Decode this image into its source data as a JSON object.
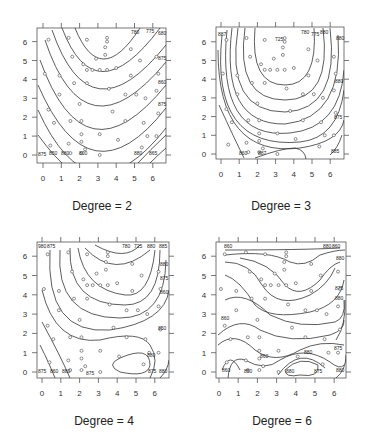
{
  "chart_data": [
    {
      "type": "contour",
      "title": "Degree = 2",
      "caption": "Degree = 2",
      "xlabel": "",
      "ylabel": "",
      "xlim": [
        -0.2,
        6.6
      ],
      "ylim": [
        -0.2,
        6.6
      ],
      "x_ticks": [
        "0",
        "1",
        "2",
        "3",
        "4",
        "5",
        "6"
      ],
      "y_ticks": [
        "0",
        "1",
        "2",
        "3",
        "4",
        "5",
        "6"
      ],
      "contour_labels": [
        "780",
        "775",
        "680",
        "875",
        "860",
        "800",
        "875",
        "850",
        "880",
        "800",
        "860",
        "850",
        "875",
        "880"
      ],
      "frame": {
        "x": 37,
        "y": 28,
        "w": 129,
        "h": 135
      },
      "axis": {
        "x0": 43,
        "xstep": 18.3,
        "y0": 155,
        "ystep": 18.9
      },
      "curves": [
        "M75,28 Q100,90 140,28",
        "M62,28 Q95,115 160,28",
        "M52,30 Q90,140 166,45",
        "M45,40 Q85,160 166,62",
        "M40,60 Q85,185 166,85",
        "M38,85 Q90,205 166,108",
        "M38,110 Q90,225 166,128",
        "M38,135 Q75,185 80,163",
        "M138,163 Q150,150 166,135",
        "M150,163 Q158,155 166,148"
      ],
      "labels": [
        {
          "t": "780",
          "x": 131,
          "y": 34
        },
        {
          "t": "775",
          "x": 146,
          "y": 33
        },
        {
          "t": "680",
          "x": 158,
          "y": 35
        },
        {
          "t": "875",
          "x": 158,
          "y": 60
        },
        {
          "t": "860",
          "x": 158,
          "y": 84
        },
        {
          "t": "875",
          "x": 158,
          "y": 106
        },
        {
          "t": "875",
          "x": 38,
          "y": 156
        },
        {
          "t": "850",
          "x": 49,
          "y": 155
        },
        {
          "t": "880",
          "x": 61,
          "y": 155
        },
        {
          "t": "800",
          "x": 79,
          "y": 155
        },
        {
          "t": "880",
          "x": 134,
          "y": 155
        },
        {
          "t": "865",
          "x": 149,
          "y": 155
        }
      ]
    },
    {
      "type": "contour",
      "title": "Degree = 3",
      "caption": "Degree = 3",
      "xlabel": "",
      "ylabel": "",
      "xlim": [
        -0.2,
        6.6
      ],
      "ylim": [
        -0.2,
        6.6
      ],
      "x_ticks": [
        "0",
        "1",
        "2",
        "3",
        "4",
        "5",
        "6"
      ],
      "y_ticks": [
        "0",
        "1",
        "2",
        "3",
        "4",
        "5",
        "6"
      ],
      "contour_labels": [
        "887",
        "780",
        "725",
        "775",
        "880",
        "880",
        "875",
        "860",
        "887",
        "885"
      ],
      "frame": {
        "x": 216,
        "y": 27,
        "w": 128,
        "h": 132
      },
      "axis": {
        "x0": 221,
        "xstep": 18.2,
        "y0": 154,
        "ystep": 18.7
      },
      "curves": [
        "M255,28 Q250,85 285,85 Q318,85 314,28",
        "M245,28 Q235,100 285,100 Q332,100 323,28",
        "M238,28 Q225,112 285,112 Q340,110 330,28",
        "M232,28 Q220,125 285,124 Q344,118 338,35",
        "M227,30 Q216,140 290,133 Q340,128 344,70",
        "M222,35 Q210,150 300,142 Q338,138 344,90",
        "M218,50 Q218,158 300,148 Q340,142 344,120",
        "M219,105 Q235,140 244,158",
        "M255,158 Q282,148 295,148 Q305,150 306,159",
        "M330,155 Q338,148 342,135"
      ],
      "labels": [
        {
          "t": "887",
          "x": 218,
          "y": 36
        },
        {
          "t": "725",
          "x": 275,
          "y": 41
        },
        {
          "t": "780",
          "x": 301,
          "y": 34
        },
        {
          "t": "775",
          "x": 311,
          "y": 36
        },
        {
          "t": "880",
          "x": 320,
          "y": 34
        },
        {
          "t": "880",
          "x": 336,
          "y": 40
        },
        {
          "t": "880",
          "x": 335,
          "y": 83
        },
        {
          "t": "875",
          "x": 334,
          "y": 119
        },
        {
          "t": "860",
          "x": 239,
          "y": 155
        },
        {
          "t": "887",
          "x": 258,
          "y": 155
        },
        {
          "t": "885",
          "x": 331,
          "y": 153
        }
      ]
    },
    {
      "type": "contour",
      "title": "Degree = 4",
      "caption": "Degree = 4",
      "xlabel": "",
      "ylabel": "",
      "xlim": [
        -0.2,
        6.6
      ],
      "ylim": [
        -0.2,
        6.6
      ],
      "x_ticks": [
        "0",
        "1",
        "2",
        "3",
        "4",
        "5",
        "6"
      ],
      "y_ticks": [
        "0",
        "1",
        "2",
        "3",
        "4",
        "5",
        "6"
      ],
      "contour_labels": [
        "980",
        "875",
        "780",
        "725",
        "880",
        "885",
        "800",
        "875",
        "860",
        "850",
        "880",
        "875"
      ],
      "frame": {
        "x": 37,
        "y": 242,
        "w": 132,
        "h": 136
      },
      "axis": {
        "x0": 42,
        "xstep": 18.8,
        "y0": 372,
        "ystep": 19.3
      },
      "curves": [
        "M95,245 Q125,262 140,245",
        "M85,248 Q115,280 150,250",
        "M78,248 Q85,290 125,295 Q150,298 155,250",
        "M70,248 Q68,305 125,305 Q160,305 160,250",
        "M60,250 Q55,318 120,318 Q165,318 166,260",
        "M50,250 Q45,335 110,330 Q165,322 169,290",
        "M42,290 Q55,345 100,340 Q140,330 150,345 Q160,360 150,378",
        "M42,322 Q60,355 70,378",
        "M40,345 Q50,365 55,378",
        "M120,358 Q150,345 150,365 Q148,378 120,372 Q105,365 120,358",
        "M160,378 Q168,370 169,360"
      ],
      "labels": [
        {
          "t": "980",
          "x": 38,
          "y": 248
        },
        {
          "t": "875",
          "x": 47,
          "y": 248
        },
        {
          "t": "780",
          "x": 122,
          "y": 248
        },
        {
          "t": "725",
          "x": 134,
          "y": 248
        },
        {
          "t": "880",
          "x": 147,
          "y": 248
        },
        {
          "t": "885",
          "x": 159,
          "y": 248
        },
        {
          "t": "880",
          "x": 160,
          "y": 266
        },
        {
          "t": "875",
          "x": 160,
          "y": 280
        },
        {
          "t": "860",
          "x": 160,
          "y": 294
        },
        {
          "t": "850",
          "x": 158,
          "y": 330
        },
        {
          "t": "880",
          "x": 147,
          "y": 357
        },
        {
          "t": "875",
          "x": 38,
          "y": 373
        },
        {
          "t": "860",
          "x": 50,
          "y": 373
        },
        {
          "t": "880",
          "x": 62,
          "y": 373
        },
        {
          "t": "875",
          "x": 86,
          "y": 375
        },
        {
          "t": "875",
          "x": 148,
          "y": 373
        },
        {
          "t": "880",
          "x": 159,
          "y": 373
        }
      ]
    },
    {
      "type": "contour",
      "title": "Degree = 6",
      "caption": "Degree = 6",
      "xlabel": "",
      "ylabel": "",
      "xlim": [
        -0.2,
        6.6
      ],
      "ylim": [
        -0.2,
        6.6
      ],
      "x_ticks": [
        "0",
        "1",
        "2",
        "3",
        "4",
        "5",
        "6"
      ],
      "y_ticks": [
        "0",
        "1",
        "2",
        "3",
        "4",
        "5",
        "6"
      ],
      "contour_labels": [
        "860",
        "850",
        "880",
        "875",
        "880",
        "880",
        "880",
        "860",
        "875",
        "880",
        "860"
      ],
      "frame": {
        "x": 216,
        "y": 242,
        "w": 130,
        "h": 136
      },
      "axis": {
        "x0": 219,
        "xstep": 19.2,
        "y0": 372,
        "ystep": 19.3
      },
      "curves": [
        "M225,250 Q300,250 340,248",
        "M225,255 Q270,250 290,262 Q305,268 320,255 Q335,250 345,250",
        "M240,258 Q270,262 285,285 Q300,300 320,280 Q330,265 340,262",
        "M225,262 Q250,262 262,285 Q278,310 310,295 Q328,285 335,268",
        "M225,275 Q240,280 255,305 Q270,320 310,312 Q340,305 344,280",
        "M225,300 Q245,290 270,315 Q300,330 335,322 Q346,318 344,300",
        "M218,335 Q240,315 260,330 Q290,345 330,335 Q345,330 344,320",
        "M218,345 Q235,330 255,350 Q275,365 300,350 Q320,340 344,345",
        "M228,378 Q230,355 245,360 Q265,372 280,360 Q305,345 330,362 Q340,370 344,365",
        "M222,370 Q230,350 240,370",
        "M285,370 Q300,355 318,365 Q320,378 300,375 Q285,378 285,370",
        "M278,375 Q300,345 325,368",
        "M336,378 Q346,370 346,355",
        "M336,340 Q346,325 345,300"
      ],
      "labels": [
        {
          "t": "860",
          "x": 224,
          "y": 248
        },
        {
          "t": "880",
          "x": 323,
          "y": 248
        },
        {
          "t": "860",
          "x": 332,
          "y": 248
        },
        {
          "t": "880",
          "x": 336,
          "y": 260
        },
        {
          "t": "875",
          "x": 335,
          "y": 290
        },
        {
          "t": "880",
          "x": 335,
          "y": 300
        },
        {
          "t": "860",
          "x": 221,
          "y": 320
        },
        {
          "t": "875",
          "x": 334,
          "y": 350
        },
        {
          "t": "880",
          "x": 304,
          "y": 354
        },
        {
          "t": "860",
          "x": 260,
          "y": 358
        },
        {
          "t": "860",
          "x": 222,
          "y": 372
        },
        {
          "t": "850",
          "x": 244,
          "y": 373
        },
        {
          "t": "880",
          "x": 286,
          "y": 373
        },
        {
          "t": "875",
          "x": 314,
          "y": 373
        },
        {
          "t": "880",
          "x": 336,
          "y": 372
        }
      ]
    }
  ],
  "captions": [
    "Degree = 2",
    "Degree = 3",
    "Degree = 4",
    "Degree = 6"
  ],
  "points": [
    [
      0.3,
      6.1
    ],
    [
      1.4,
      6.2
    ],
    [
      2.4,
      6.1
    ],
    [
      3.5,
      6.2
    ],
    [
      3.5,
      6.0
    ],
    [
      3.4,
      5.7
    ],
    [
      4.8,
      5.6
    ],
    [
      1.6,
      5.2
    ],
    [
      2.9,
      5.1
    ],
    [
      3.4,
      5.3
    ],
    [
      5.3,
      5.0
    ],
    [
      6.2,
      5.2
    ],
    [
      2.2,
      4.8
    ],
    [
      2.4,
      4.5
    ],
    [
      2.7,
      4.5
    ],
    [
      3.1,
      4.5
    ],
    [
      3.5,
      4.5
    ],
    [
      4.0,
      4.6
    ],
    [
      0.1,
      4.3
    ],
    [
      0.9,
      4.2
    ],
    [
      4.8,
      4.2
    ],
    [
      6.3,
      4.3
    ],
    [
      1.7,
      3.8
    ],
    [
      2.4,
      3.8
    ],
    [
      3.6,
      3.5
    ],
    [
      0.9,
      3.2
    ],
    [
      4.5,
      3.2
    ],
    [
      5.1,
      3.2
    ],
    [
      5.6,
      3.0
    ],
    [
      6.2,
      3.4
    ],
    [
      2.0,
      2.7
    ],
    [
      3.8,
      2.3
    ],
    [
      0.3,
      2.4
    ],
    [
      6.3,
      2.2
    ],
    [
      0.6,
      1.7
    ],
    [
      1.5,
      1.8
    ],
    [
      2.1,
      1.8
    ],
    [
      4.5,
      1.8
    ],
    [
      5.5,
      1.7
    ],
    [
      2.1,
      1.1
    ],
    [
      3.1,
      1.1
    ],
    [
      5.7,
      1.0
    ],
    [
      6.2,
      1.0
    ],
    [
      0.4,
      0.5
    ],
    [
      1.4,
      0.6
    ],
    [
      2.1,
      0.7
    ],
    [
      4.1,
      0.8
    ],
    [
      5.4,
      0.4
    ],
    [
      2.3,
      0.3
    ],
    [
      3.1,
      0.0
    ],
    [
      1.5,
      0.1
    ],
    [
      2.1,
      0.1
    ]
  ]
}
